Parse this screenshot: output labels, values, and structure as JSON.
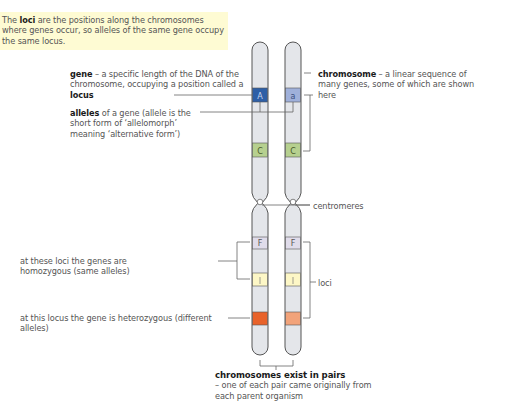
{
  "note": {
    "pre": "The ",
    "bold": "loci",
    "post": " are the positions along the chromosomes where genes occur, so alleles of the same gene occupy the same locus.",
    "background": "#fefbd3"
  },
  "labels": {
    "gene": {
      "bold": "gene",
      "text": " – a specific length of the DNA of the chromosome, occupying a position called a ",
      "bold2": "locus"
    },
    "alleles": {
      "bold": "alleles",
      "text": " of a gene (allele is the short form of ‘allelomorph’ meaning ‘alternative form’)"
    },
    "chromosome": {
      "bold": "chromosome",
      "text": " – a linear sequence of many genes, some of which are shown here"
    },
    "centromeres": "centromeres",
    "homozygous": "at these loci the genes are homozygous (same alleles)",
    "loci": "loci",
    "heterozygous": "at this locus the gene is heterozygous (different alleles)",
    "pairs": {
      "bold": "chromosomes exist in pairs",
      "text": "– one of each pair came originally from each parent organism"
    }
  },
  "chromosomes": [
    {
      "id": "left",
      "bands": [
        {
          "label": "A",
          "color": "#2e5fa6",
          "text_color": "#c9d6ee"
        },
        {
          "label": "C",
          "color": "#b6d08f",
          "text_color": "#4a5a2a"
        },
        {
          "label": "F",
          "color": "#e0dcea",
          "text_color": "#555"
        },
        {
          "label": "J",
          "color": "#fdf7c6",
          "text_color": "#777"
        },
        {
          "label": "",
          "color": "#e8622a",
          "text_color": "#fff"
        }
      ]
    },
    {
      "id": "right",
      "bands": [
        {
          "label": "a",
          "color": "#9fb0da",
          "text_color": "#3b4f80"
        },
        {
          "label": "C",
          "color": "#b6d08f",
          "text_color": "#4a5a2a"
        },
        {
          "label": "F",
          "color": "#e0dcea",
          "text_color": "#555"
        },
        {
          "label": "J",
          "color": "#fdf7c6",
          "text_color": "#777"
        },
        {
          "label": "",
          "color": "#f2a37a",
          "text_color": "#fff"
        }
      ]
    }
  ],
  "colors": {
    "chromosome_fill": "#e4e6ea",
    "outline": "#555555",
    "leader_line": "#666666"
  }
}
